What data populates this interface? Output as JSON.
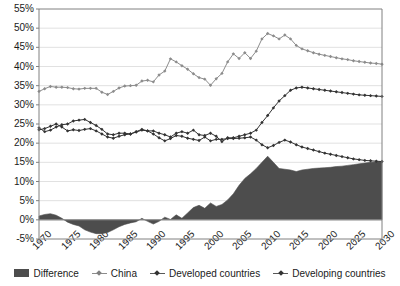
{
  "chart_data": {
    "type": "area",
    "title": "",
    "xlabel": "",
    "ylabel": "",
    "xlim": [
      1970,
      2030
    ],
    "ylim": [
      -5,
      55
    ],
    "ytick_labels": [
      "55%",
      "50%",
      "45%",
      "40%",
      "35%",
      "30%",
      "25%",
      "20%",
      "15%",
      "10%",
      "5%",
      "0%",
      "-5%"
    ],
    "ytick_values": [
      55,
      50,
      45,
      40,
      35,
      30,
      25,
      20,
      15,
      10,
      5,
      0,
      -5
    ],
    "xtick_labels": [
      "1970",
      "1975",
      "1980",
      "1985",
      "1990",
      "1995",
      "2000",
      "2005",
      "2010",
      "2015",
      "2020",
      "2025",
      "2030"
    ],
    "xtick_values": [
      1970,
      1975,
      1980,
      1985,
      1990,
      1995,
      2000,
      2005,
      2010,
      2015,
      2020,
      2025,
      2030
    ],
    "grid": true,
    "legend_position": "bottom",
    "x": [
      1970,
      1971,
      1972,
      1973,
      1974,
      1975,
      1976,
      1977,
      1978,
      1979,
      1980,
      1981,
      1982,
      1983,
      1984,
      1985,
      1986,
      1987,
      1988,
      1989,
      1990,
      1991,
      1992,
      1993,
      1994,
      1995,
      1996,
      1997,
      1998,
      1999,
      2000,
      2001,
      2002,
      2003,
      2004,
      2005,
      2006,
      2007,
      2008,
      2009,
      2010,
      2011,
      2012,
      2013,
      2014,
      2015,
      2016,
      2017,
      2018,
      2019,
      2020,
      2021,
      2022,
      2023,
      2024,
      2025,
      2026,
      2027,
      2028,
      2029,
      2030
    ],
    "series": [
      {
        "name": "Difference",
        "kind": "area",
        "color": "#4d4d4d",
        "values": [
          1.0,
          1.4,
          1.6,
          1.2,
          0.4,
          -0.6,
          -1.2,
          -1.6,
          -2.6,
          -3.2,
          -3.6,
          -3.6,
          -3.3,
          -2.6,
          -1.8,
          -1.2,
          -0.8,
          -0.5,
          0.4,
          -0.4,
          -1.1,
          -0.4,
          0.7,
          0.1,
          1.3,
          0.4,
          1.8,
          3.2,
          3.8,
          3.0,
          4.4,
          3.5,
          4.0,
          5.2,
          6.8,
          9.0,
          10.8,
          12.0,
          13.4,
          15.0,
          16.6,
          15.0,
          13.4,
          13.2,
          13.0,
          12.6,
          13.0,
          13.2,
          13.4,
          13.5,
          13.6,
          13.7,
          13.9,
          14.0,
          14.2,
          14.4,
          14.6,
          14.8,
          15.0,
          15.1,
          15.2
        ]
      },
      {
        "name": "China",
        "kind": "line",
        "color": "#8c8c8c",
        "values": [
          33.5,
          34.2,
          34.8,
          34.6,
          34.6,
          34.5,
          34.2,
          34.1,
          34.3,
          34.3,
          34.3,
          33.3,
          32.7,
          33.5,
          34.4,
          34.9,
          35.0,
          35.1,
          36.2,
          36.4,
          36.0,
          37.8,
          38.8,
          42.0,
          41.2,
          40.2,
          39.3,
          38.1,
          37.1,
          36.7,
          35.1,
          36.8,
          38.2,
          41.2,
          43.3,
          42.1,
          43.6,
          42.1,
          44.0,
          47.2,
          48.6,
          48.0,
          47.2,
          48.2,
          47.2,
          45.5,
          44.6,
          44.1,
          43.6,
          43.2,
          42.9,
          42.6,
          42.3,
          42.0,
          41.8,
          41.5,
          41.3,
          41.1,
          40.9,
          40.8,
          40.6
        ]
      },
      {
        "name": "Developed countries",
        "kind": "line",
        "color": "#333333",
        "values": [
          23.5,
          23.8,
          24.4,
          25.0,
          24.2,
          23.2,
          23.5,
          23.3,
          23.6,
          23.8,
          23.2,
          22.4,
          21.6,
          21.3,
          21.8,
          22.2,
          22.4,
          22.9,
          23.4,
          23.2,
          23.2,
          22.6,
          22.2,
          21.6,
          22.6,
          23.0,
          22.6,
          23.4,
          22.2,
          22.0,
          22.6,
          21.8,
          20.4,
          21.4,
          21.4,
          21.8,
          22.2,
          22.6,
          23.4,
          25.4,
          27.2,
          29.2,
          31.0,
          32.4,
          33.8,
          34.4,
          34.6,
          34.4,
          34.2,
          34.0,
          33.8,
          33.6,
          33.4,
          33.2,
          33.0,
          32.8,
          32.6,
          32.5,
          32.4,
          32.3,
          32.2
        ]
      },
      {
        "name": "Developing countries",
        "kind": "line",
        "color": "#333333",
        "values": [
          24.0,
          23.0,
          23.4,
          24.2,
          24.8,
          25.0,
          25.8,
          26.0,
          26.2,
          25.4,
          24.6,
          23.6,
          22.4,
          22.2,
          22.6,
          22.6,
          22.4,
          23.0,
          23.6,
          23.2,
          22.4,
          21.4,
          20.6,
          21.2,
          22.0,
          21.8,
          21.3,
          21.0,
          20.7,
          21.6,
          20.6,
          21.0,
          21.0,
          21.2,
          21.2,
          21.3,
          21.4,
          21.6,
          20.8,
          19.6,
          18.8,
          19.4,
          20.2,
          20.8,
          20.3,
          19.6,
          19.0,
          18.6,
          18.2,
          17.8,
          17.4,
          17.1,
          16.8,
          16.5,
          16.2,
          15.9,
          15.7,
          15.5,
          15.4,
          15.3,
          15.2
        ]
      }
    ]
  },
  "legend": {
    "items": [
      {
        "label": "Difference",
        "type": "area"
      },
      {
        "label": "China",
        "type": "line-light"
      },
      {
        "label": "Developed countries",
        "type": "line-dark"
      },
      {
        "label": "Developing countries",
        "type": "line-dark"
      }
    ]
  }
}
